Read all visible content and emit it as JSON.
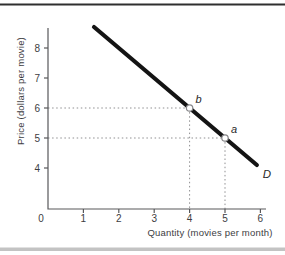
{
  "figure": {
    "background": "#ffffff",
    "top_rule_color": "#2f2f2f",
    "bottom_rule_color": "#c3c3c3"
  },
  "chart_data": {
    "type": "line",
    "title": "",
    "xlabel": "Quantity (movies per month)",
    "ylabel": "Price (dollars per movie)",
    "x_ticks": [
      0,
      1,
      2,
      3,
      4,
      5,
      6
    ],
    "y_ticks": [
      4,
      5,
      6,
      7,
      8
    ],
    "origin_label": "0",
    "xlim": [
      0,
      6.2
    ],
    "ylim_labeled": [
      4,
      8
    ],
    "grid": false,
    "legend": "none",
    "line_color": "#141414",
    "axis_color": "#58585a",
    "text_color": "#3d3d3f",
    "guide_color": "#8f8f91",
    "marker_fill": "#ffffff",
    "marker_stroke": "#87878a",
    "series": [
      {
        "name": "D",
        "points": [
          [
            1.3,
            8.7
          ],
          [
            5.9,
            4.1
          ]
        ]
      }
    ],
    "annotated_points": [
      {
        "label": "b",
        "quantity": 4,
        "price": 6
      },
      {
        "label": "a",
        "quantity": 5,
        "price": 5
      }
    ]
  }
}
